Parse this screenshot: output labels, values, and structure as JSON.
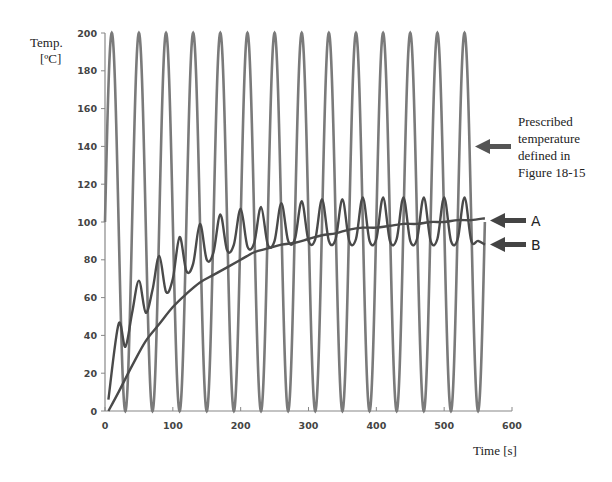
{
  "chart_data": {
    "type": "line",
    "title": "",
    "xlabel": "Time [s]",
    "ylabel_line1": "Temp.",
    "ylabel_line2": "[ºC]",
    "xlim": [
      0,
      600
    ],
    "ylim": [
      0,
      200
    ],
    "x_ticks": [
      0,
      100,
      200,
      300,
      400,
      500,
      600
    ],
    "y_ticks": [
      0,
      20,
      40,
      60,
      80,
      100,
      120,
      140,
      160,
      180,
      200
    ],
    "grid": false,
    "series": [
      {
        "name": "Prescribed temperature",
        "description": "Sinusoidal prescribed temperature oscillating between 0 and 200 ºC with ~40 s period",
        "amplitude": 100,
        "mean": 100,
        "period_s": 40,
        "x_range": [
          0,
          560
        ],
        "color": "#7a7a7a"
      },
      {
        "name": "B",
        "description": "Oscillating response (larger amplitude), peaks rising from ~47 to ~113",
        "x": [
          5,
          20,
          30,
          40,
          50,
          60,
          70,
          80,
          90,
          100,
          110,
          120,
          130,
          140,
          150,
          160,
          170,
          180,
          190,
          200,
          210,
          220,
          230,
          240,
          250,
          260,
          270,
          280,
          290,
          300,
          310,
          320,
          330,
          340,
          350,
          360,
          370,
          380,
          390,
          400,
          410,
          420,
          430,
          440,
          450,
          460,
          470,
          480,
          490,
          500,
          510,
          520,
          530,
          540,
          550,
          560
        ],
        "y": [
          6,
          46,
          34,
          52,
          69,
          52,
          64,
          82,
          63,
          70,
          92,
          74,
          78,
          99,
          80,
          84,
          104,
          85,
          88,
          107,
          87,
          89,
          108,
          88,
          90,
          110,
          90,
          91,
          111,
          90,
          91,
          112,
          90,
          91,
          112,
          90,
          91,
          113,
          90,
          91,
          113,
          90,
          91,
          113,
          90,
          91,
          113,
          90,
          91,
          113,
          90,
          91,
          113,
          90,
          90,
          88
        ],
        "color": "#4a4a4a"
      },
      {
        "name": "A",
        "description": "Smoother response rising from 0 to ~101",
        "x": [
          5,
          20,
          40,
          60,
          80,
          100,
          120,
          140,
          160,
          180,
          200,
          220,
          240,
          260,
          280,
          300,
          320,
          340,
          360,
          380,
          400,
          420,
          440,
          460,
          480,
          500,
          520,
          540,
          560
        ],
        "y": [
          0,
          10,
          24,
          37,
          46,
          55,
          62,
          68,
          72,
          76,
          80,
          84,
          86,
          88,
          89,
          91,
          93,
          94,
          96,
          97,
          97,
          98,
          99,
          99,
          100,
          100,
          101,
          101,
          102
        ],
        "color": "#4a4a4a"
      }
    ],
    "annotations": [
      {
        "text_lines": [
          "Prescribed",
          "temperature",
          "defined in",
          "Figure 18-15"
        ],
        "arrow_target_y": 155
      },
      {
        "text": "A",
        "arrow_target_y": 101
      },
      {
        "text": "B",
        "arrow_target_y": 88
      }
    ]
  },
  "labels": {
    "ylabel_line1": "Temp.",
    "ylabel_line2": "[ºC]",
    "xlabel": "Time [s]",
    "note_line1": "Prescribed",
    "note_line2": "temperature",
    "note_line3": "defined in",
    "note_line4": "Figure 18-15",
    "marker_a": "A",
    "marker_b": "B"
  }
}
